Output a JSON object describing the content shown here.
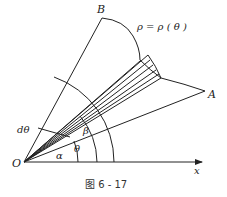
{
  "figure": {
    "caption": "图 6 - 17",
    "curve_label": "ρ = ρ ( θ )",
    "points": {
      "origin": "O",
      "b": "B",
      "a": "A"
    },
    "axis_label": "x",
    "angles": {
      "alpha": "α",
      "theta": "θ",
      "beta": "β",
      "dtheta": "dθ"
    }
  }
}
